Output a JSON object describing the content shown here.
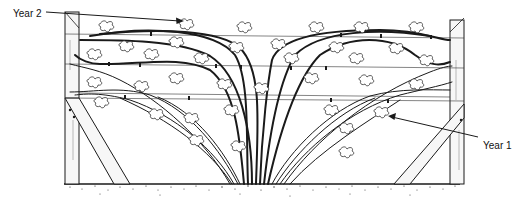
{
  "figure": {
    "labels": {
      "year2": "Year 2",
      "year1": "Year 1"
    },
    "colors": {
      "ink": "#1a1a1a",
      "background": "#ffffff",
      "wood": "#f4f4f4",
      "soil": "#2a2a2a"
    },
    "trellis": {
      "posts": 2,
      "wires": 4,
      "braces": 2
    }
  }
}
